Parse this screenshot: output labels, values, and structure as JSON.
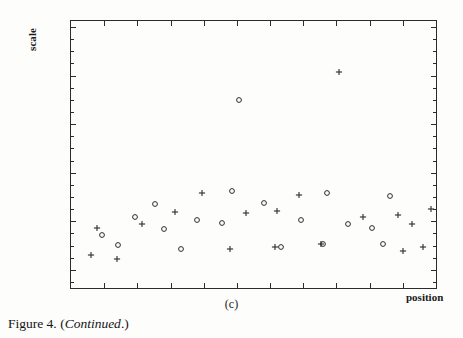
{
  "figure": {
    "caption_prefix": "Figure 4.",
    "caption_paren_open": "(",
    "caption_italic": "Continued",
    "caption_paren_close": ".)",
    "panel_label": "(c)",
    "ink_color": "#1a1a1a",
    "background_color": "#fdfdfc",
    "axis_color": "#2b2b2b"
  },
  "chart_data": {
    "type": "scatter",
    "title": "",
    "subtitle": "",
    "xlabel": "position",
    "ylabel": "scale",
    "panel": "(c)",
    "grid": false,
    "legend_position": "none",
    "xlim": [
      0,
      100
    ],
    "ylim": [
      0,
      100
    ],
    "axis_tick_labels_shown": false,
    "x_tick_count": 10,
    "y_minor_tick_count": 22,
    "annotations": [],
    "series": [
      {
        "name": "circle-series",
        "marker": "open-circle",
        "points": [
          [
            23.0,
            31.5
          ],
          [
            17.5,
            26.5
          ],
          [
            25.5,
            22.0
          ],
          [
            46.0,
            70.5
          ],
          [
            44.0,
            36.5
          ],
          [
            53.0,
            32.0
          ],
          [
            41.5,
            24.5
          ],
          [
            34.5,
            25.5
          ],
          [
            70.0,
            35.5
          ],
          [
            63.0,
            25.5
          ],
          [
            76.0,
            24.0
          ],
          [
            87.5,
            34.5
          ],
          [
            82.5,
            22.5
          ],
          [
            85.5,
            16.5
          ],
          [
            69.0,
            16.5
          ],
          [
            57.5,
            15.5
          ],
          [
            8.5,
            20.0
          ],
          [
            13.0,
            16.0
          ],
          [
            30.0,
            14.5
          ]
        ]
      },
      {
        "name": "plus-series",
        "marker": "plus",
        "points": [
          [
            36.0,
            35.5
          ],
          [
            62.5,
            35.0
          ],
          [
            73.5,
            81.0
          ],
          [
            48.0,
            28.0
          ],
          [
            56.5,
            29.0
          ],
          [
            28.5,
            28.5
          ],
          [
            19.5,
            24.0
          ],
          [
            7.0,
            22.5
          ],
          [
            89.5,
            27.5
          ],
          [
            93.5,
            24.0
          ],
          [
            80.0,
            26.5
          ],
          [
            98.5,
            29.5
          ],
          [
            43.5,
            14.5
          ],
          [
            68.5,
            16.5
          ],
          [
            56.0,
            15.5
          ],
          [
            5.5,
            12.5
          ],
          [
            91.0,
            14.0
          ],
          [
            96.5,
            15.5
          ],
          [
            12.5,
            11.0
          ]
        ]
      }
    ]
  }
}
